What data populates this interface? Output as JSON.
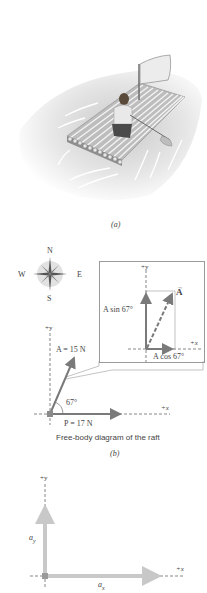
{
  "figure_a": {
    "caption": "(a)",
    "illustration": "raft-with-sail-and-person"
  },
  "compass": {
    "north": "N",
    "south": "S",
    "west": "W",
    "east": "E"
  },
  "inset": {
    "y_axis_label": "+y",
    "x_axis_label": "+x",
    "vector_label": "A",
    "y_component_label": "A sin 67°",
    "x_component_label": "A cos 67°"
  },
  "figure_b": {
    "y_axis_label": "+y",
    "x_axis_label": "+x",
    "force_a_label": "A = 15 N",
    "force_p_label": "P = 17 N",
    "angle_label": "67°",
    "description": "Free-body diagram of the raft",
    "caption": "(b)"
  },
  "figure_c": {
    "y_axis_label": "+y",
    "x_axis_label": "+x",
    "ay_label": "a",
    "ay_subscript": "y",
    "ax_label": "a",
    "ax_subscript": "x"
  },
  "colors": {
    "vector_dark": "#7a7a7a",
    "vector_light": "#c8c8c8",
    "axis_dashed": "#555555",
    "box_border": "#9a9a9a",
    "water_shadow": "#d9d9d9"
  }
}
